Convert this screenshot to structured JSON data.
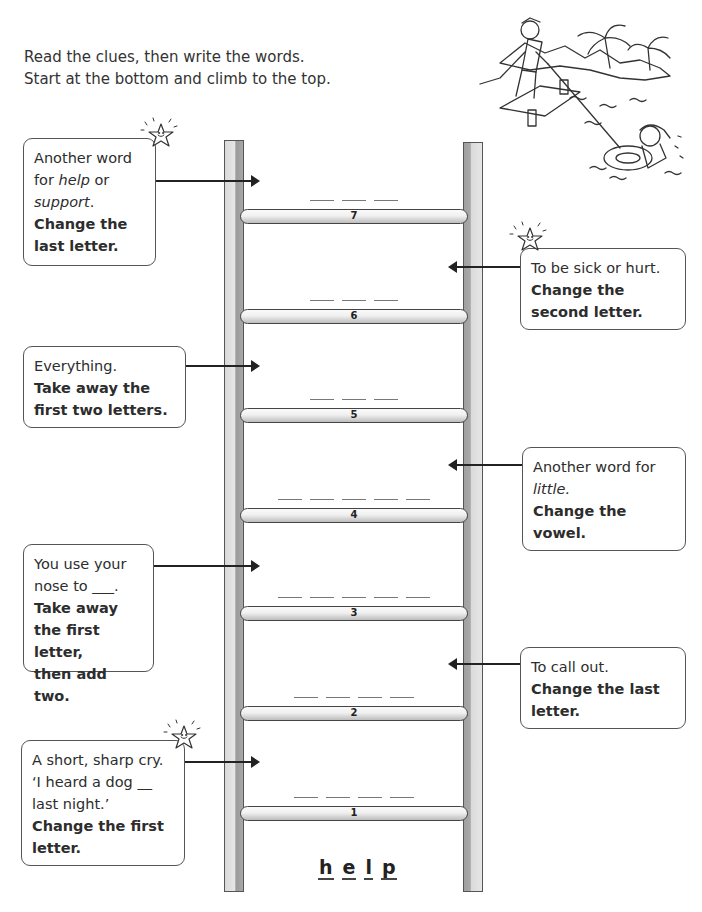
{
  "instructions": {
    "line1": "Read the clues, then write the words.",
    "line2": "Start at the bottom and climb to the top."
  },
  "clues": [
    {
      "rung": 7,
      "side": "left",
      "parts": [
        {
          "t": "Another word",
          "s": "n"
        },
        {
          "t": "for ",
          "s": "n"
        },
        {
          "t": "help",
          "s": "i"
        },
        {
          "t": " or",
          "s": "n"
        },
        {
          "t": "support",
          "s": "i"
        },
        {
          "t": ".",
          "s": "n"
        }
      ],
      "lines": [
        "Another word",
        "for help or",
        "support."
      ],
      "instruction": [
        "Change the",
        "last letter."
      ]
    },
    {
      "rung": 6,
      "side": "right",
      "lines": [
        "To be sick or hurt."
      ],
      "instruction": [
        "Change the",
        "second letter."
      ]
    },
    {
      "rung": 5,
      "side": "left",
      "lines": [
        "Everything."
      ],
      "instruction": [
        "Take away the",
        "first two letters."
      ]
    },
    {
      "rung": 4,
      "side": "right",
      "lines": [
        "Another word for",
        "little."
      ],
      "instruction": [
        "Change the",
        "vowel."
      ]
    },
    {
      "rung": 3,
      "side": "left",
      "lines": [
        "You use your",
        "nose to ___."
      ],
      "instruction": [
        "Take away",
        "the first letter,",
        "then add two."
      ]
    },
    {
      "rung": 2,
      "side": "right",
      "lines": [
        "To call out."
      ],
      "instruction": [
        "Change the last",
        "letter."
      ]
    },
    {
      "rung": 1,
      "side": "left",
      "lines": [
        "A short, sharp cry.",
        "‘I heard a dog __",
        "last night.’"
      ],
      "instruction": [
        "Change the first",
        "letter."
      ]
    }
  ],
  "rungs": [
    {
      "number": "7",
      "blanks": 3
    },
    {
      "number": "6",
      "blanks": 3
    },
    {
      "number": "5",
      "blanks": 3
    },
    {
      "number": "4",
      "blanks": 5
    },
    {
      "number": "3",
      "blanks": 5
    },
    {
      "number": "2",
      "blanks": 4
    },
    {
      "number": "1",
      "blanks": 4
    }
  ],
  "start_word": {
    "letters": [
      "h",
      "e",
      "l",
      "p"
    ]
  },
  "icons": {
    "star": "smiling-star-icon",
    "illustration": "rescue-at-sea-illustration"
  }
}
